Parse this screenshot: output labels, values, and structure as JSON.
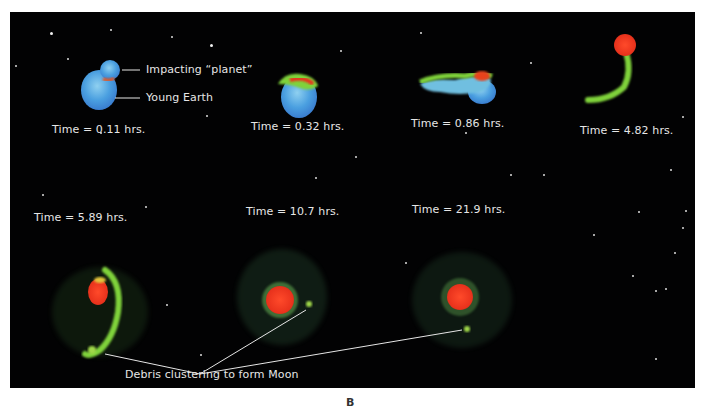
{
  "figure": {
    "panel_label": "B",
    "colors": {
      "background": "#020203",
      "earth_blue": "#4a9fe0",
      "core_red": "#e8321c",
      "debris_green": "#7fd23a",
      "label_text": "#e6e6e6"
    },
    "annotations": {
      "impactor": "Impacting “planet”",
      "earth": "Young Earth",
      "debris": "Debris clustering to form Moon"
    },
    "frames": [
      {
        "label": "Time = 0.11 hrs."
      },
      {
        "label": "Time = 0.32 hrs."
      },
      {
        "label": "Time = 0.86 hrs."
      },
      {
        "label": "Time = 4.82 hrs."
      },
      {
        "label": "Time = 5.89 hrs."
      },
      {
        "label": "Time = 10.7 hrs."
      },
      {
        "label": "Time = 21.9 hrs."
      }
    ]
  }
}
